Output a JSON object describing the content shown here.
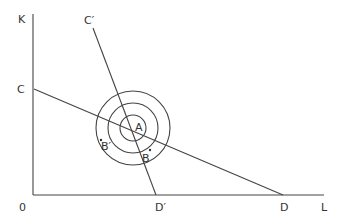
{
  "diagram": {
    "type": "isoquant-isocost",
    "axes": {
      "origin_label": "0",
      "y_label": "K",
      "x_label": "L"
    },
    "lines": [
      {
        "name": "budget-line-CD",
        "from_label": "C",
        "to_label": "D"
      },
      {
        "name": "budget-line-C'D'",
        "from_label": "C′",
        "to_label": "D′"
      }
    ],
    "points": {
      "center": "A",
      "point_b": "B",
      "point_b_prime": "B′"
    },
    "circles": {
      "count": 3
    }
  },
  "colors": {
    "line": "#444444",
    "text": "#333333",
    "background": "#ffffff"
  }
}
